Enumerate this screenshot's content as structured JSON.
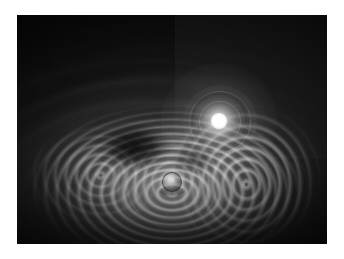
{
  "page": {
    "background_color": "#ffffff",
    "width": 344,
    "height": 259
  },
  "photograph": {
    "title": "",
    "caption": "",
    "medium": "grayscale photograph",
    "subject": "optical caustic pattern formed by a point light source and a small sphere",
    "frame": {
      "left": 17,
      "top": 15,
      "width": 310,
      "height": 229,
      "background_color": "#0a0a0a",
      "border_color": "#ffffff"
    },
    "palette": {
      "paper": "#ffffff",
      "field_dark": "#0a0a0a",
      "field_mid": "#3a3a3a",
      "fringe_bright": "#e8e8e8",
      "highlight": "#ffffff",
      "void": "#000000"
    },
    "elements": [
      {
        "name": "light-source",
        "label": "point light source",
        "x_pct": 65.2,
        "y_pct": 46.3,
        "core_color": "#ffffff",
        "glow_radius_px": 26,
        "halo_rings": 2
      },
      {
        "name": "small-sphere",
        "label": "small reflective sphere",
        "x_pct": 50.0,
        "y_pct": 73.0,
        "diameter_px": 18,
        "rim_color": "#0e0e0e",
        "highlight_color": "#ffffff"
      },
      {
        "name": "caustic-bowl",
        "label": "concentric caustic fringes",
        "center_x_pct": 49,
        "center_y_pct": 74
      },
      {
        "name": "void-ellipse",
        "label": "dark elliptical void",
        "center_x_pct": 38,
        "center_y_pct": 58
      },
      {
        "name": "panel-right",
        "label": "lighter rectangular panel",
        "left_pct": 51,
        "top_pct": 0,
        "width_pct": 49,
        "height_pct": 63
      },
      {
        "name": "arc-sweep",
        "label": "broad sweeping light arcs",
        "region": "left hemisphere"
      }
    ]
  }
}
